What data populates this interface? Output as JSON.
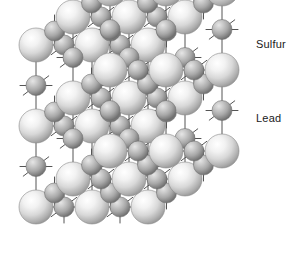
{
  "figure": {
    "type": "crystal-lattice-diagram",
    "structure": "rock-salt (face-centered cubic)",
    "background_color": "#ffffff",
    "bond_line_color": "#555555",
    "bond_line_width": 1
  },
  "labels": {
    "sulfur": "Sulfur",
    "lead": "Lead",
    "label_color": "#1a1a1a",
    "label_font_size": "11px"
  },
  "species": [
    {
      "key": "sulfur",
      "name": "Sulfur",
      "role": "large-sphere",
      "radius": 17,
      "fill_light": "#ffffff",
      "fill_mid": "#e2e2e2",
      "fill_dark": "#9a9a9a",
      "edge_color": "#8a8a8a"
    },
    {
      "key": "lead",
      "name": "Lead",
      "role": "small-sphere",
      "radius": 10,
      "fill_light": "#dcdcdc",
      "fill_mid": "#b4b4b4",
      "fill_dark": "#6f6f6f",
      "edge_color": "#707070"
    }
  ],
  "chart_data": {
    "type": "scatter",
    "xlabel": "",
    "ylabel": "",
    "projection": "oblique",
    "grid": false,
    "legend_position": "right",
    "legend": [
      "Sulfur",
      "Lead"
    ],
    "lattice": {
      "cells": 2,
      "origin_x": 36,
      "origin_y": 207,
      "axis_a": [
        56.0,
        0.0
      ],
      "axis_b": [
        0.0,
        -81.0
      ],
      "axis_c": [
        37.0,
        -28.0
      ],
      "half_step_note": "sulfur at integer sites, lead at half-integer sites along each axis",
      "stub_length": 16
    },
    "points": [
      {
        "species": "Sulfur",
        "i": 0,
        "j": 0,
        "k": 0,
        "x": 36,
        "y": 207
      },
      {
        "species": "Sulfur",
        "i": 1,
        "j": 0,
        "k": 0,
        "x": 92,
        "y": 207
      },
      {
        "species": "Sulfur",
        "i": 2,
        "j": 0,
        "k": 0,
        "x": 148,
        "y": 207
      },
      {
        "species": "Sulfur",
        "i": 0,
        "j": 1,
        "k": 0,
        "x": 36,
        "y": 126
      },
      {
        "species": "Sulfur",
        "i": 1,
        "j": 1,
        "k": 0,
        "x": 92,
        "y": 126
      },
      {
        "species": "Sulfur",
        "i": 2,
        "j": 1,
        "k": 0,
        "x": 148,
        "y": 126
      },
      {
        "species": "Sulfur",
        "i": 0,
        "j": 2,
        "k": 0,
        "x": 36,
        "y": 45
      },
      {
        "species": "Sulfur",
        "i": 1,
        "j": 2,
        "k": 0,
        "x": 92,
        "y": 45
      },
      {
        "species": "Sulfur",
        "i": 2,
        "j": 2,
        "k": 0,
        "x": 148,
        "y": 45
      },
      {
        "species": "Sulfur",
        "i": 0,
        "j": 0,
        "k": 1,
        "x": 73,
        "y": 179
      },
      {
        "species": "Sulfur",
        "i": 1,
        "j": 0,
        "k": 1,
        "x": 129,
        "y": 179
      },
      {
        "species": "Sulfur",
        "i": 2,
        "j": 0,
        "k": 1,
        "x": 185,
        "y": 179
      },
      {
        "species": "Sulfur",
        "i": 0,
        "j": 1,
        "k": 1,
        "x": 73,
        "y": 98
      },
      {
        "species": "Sulfur",
        "i": 1,
        "j": 1,
        "k": 1,
        "x": 129,
        "y": 98
      },
      {
        "species": "Sulfur",
        "i": 2,
        "j": 1,
        "k": 1,
        "x": 185,
        "y": 98
      },
      {
        "species": "Sulfur",
        "i": 0,
        "j": 2,
        "k": 1,
        "x": 73,
        "y": 17
      },
      {
        "species": "Sulfur",
        "i": 1,
        "j": 2,
        "k": 1,
        "x": 129,
        "y": 17
      },
      {
        "species": "Sulfur",
        "i": 2,
        "j": 2,
        "k": 1,
        "x": 185,
        "y": 17
      },
      {
        "species": "Sulfur",
        "i": 0,
        "j": 0,
        "k": 2,
        "x": 110,
        "y": 151
      },
      {
        "species": "Sulfur",
        "i": 1,
        "j": 0,
        "k": 2,
        "x": 166,
        "y": 151
      },
      {
        "species": "Sulfur",
        "i": 2,
        "j": 0,
        "k": 2,
        "x": 222,
        "y": 151
      },
      {
        "species": "Sulfur",
        "i": 0,
        "j": 1,
        "k": 2,
        "x": 110,
        "y": 70
      },
      {
        "species": "Sulfur",
        "i": 1,
        "j": 1,
        "k": 2,
        "x": 166,
        "y": 70
      },
      {
        "species": "Sulfur",
        "i": 2,
        "j": 1,
        "k": 2,
        "x": 222,
        "y": 70
      },
      {
        "species": "Lead",
        "x": 64,
        "y": 207
      },
      {
        "species": "Lead",
        "x": 120,
        "y": 207
      },
      {
        "species": "Lead",
        "x": 36,
        "y": 167
      },
      {
        "species": "Lead",
        "x": 92,
        "y": 167
      },
      {
        "species": "Lead",
        "x": 148,
        "y": 167
      },
      {
        "species": "Lead",
        "x": 64,
        "y": 126
      },
      {
        "species": "Lead",
        "x": 120,
        "y": 126
      },
      {
        "species": "Lead",
        "x": 36,
        "y": 86
      },
      {
        "species": "Lead",
        "x": 92,
        "y": 86
      },
      {
        "species": "Lead",
        "x": 148,
        "y": 86
      },
      {
        "species": "Lead",
        "x": 64,
        "y": 45
      },
      {
        "species": "Lead",
        "x": 120,
        "y": 45
      },
      {
        "species": "Lead",
        "x": 101,
        "y": 179
      },
      {
        "species": "Lead",
        "x": 157,
        "y": 179
      },
      {
        "species": "Lead",
        "x": 73,
        "y": 139
      },
      {
        "species": "Lead",
        "x": 129,
        "y": 139
      },
      {
        "species": "Lead",
        "x": 185,
        "y": 139
      },
      {
        "species": "Lead",
        "x": 101,
        "y": 98
      },
      {
        "species": "Lead",
        "x": 157,
        "y": 98
      },
      {
        "species": "Lead",
        "x": 73,
        "y": 58
      },
      {
        "species": "Lead",
        "x": 129,
        "y": 58
      },
      {
        "species": "Lead",
        "x": 185,
        "y": 58
      },
      {
        "species": "Lead",
        "x": 101,
        "y": 17
      },
      {
        "species": "Lead",
        "x": 157,
        "y": 17
      },
      {
        "species": "Lead",
        "x": 138,
        "y": 151
      },
      {
        "species": "Lead",
        "x": 194,
        "y": 151
      },
      {
        "species": "Lead",
        "x": 110,
        "y": 110
      },
      {
        "species": "Lead",
        "x": 166,
        "y": 110
      },
      {
        "species": "Lead",
        "x": 222,
        "y": 110
      },
      {
        "species": "Lead",
        "x": 138,
        "y": 70
      },
      {
        "species": "Lead",
        "x": 194,
        "y": 70
      }
    ]
  }
}
